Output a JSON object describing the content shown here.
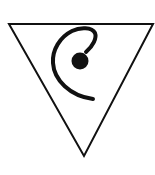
{
  "symbol": {
    "label": "Inverted triangle with spiral and dot",
    "icon": "inverted-triangle-spiral-icon",
    "stroke_color": "#111111",
    "fill_color": "#ffffff",
    "background": "#ffffff"
  }
}
